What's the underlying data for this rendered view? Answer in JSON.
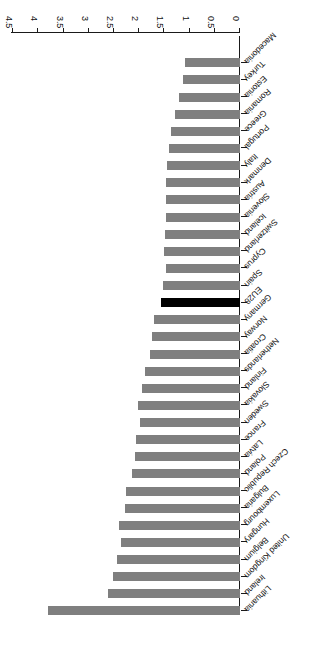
{
  "chart_data": {
    "type": "bar",
    "orientation": "horizontal",
    "title": "",
    "subtitle": "",
    "xlabel": "",
    "ylabel": "",
    "xlim": [
      0,
      4.5
    ],
    "grid": false,
    "legend": false,
    "rotation_deg": 180,
    "bar_color": "#7f7f7f",
    "highlight_color": "#000000",
    "highlight_category": "EU28",
    "axis_ticks": [
      "0",
      "0.5",
      "1",
      "1.5",
      "2",
      "2.5",
      "3",
      "3.5",
      "4",
      "4.5"
    ],
    "axis_tick_values": [
      0,
      0.5,
      1,
      1.5,
      2,
      2.5,
      3,
      3.5,
      4,
      4.5
    ],
    "categories": [
      "Lithuania",
      "Ireland",
      "United Kingdom",
      "Belgium",
      "Hungary",
      "Luxembourg",
      "Bulgaria",
      "Czech Republic",
      "Poland",
      "Latvia",
      "France",
      "Sweden",
      "Slovakia",
      "Finland",
      "Netherlands",
      "Croatia",
      "Norway",
      "Germany",
      "EU28",
      "Spain",
      "Cyprus",
      "Switzerland",
      "Iceland",
      "Slovenia",
      "Austria",
      "Denmark",
      "Italy",
      "Portugal",
      "Greece",
      "Romania",
      "Estonia",
      "Turkey",
      "Macedonia"
    ],
    "values": [
      3.81,
      2.62,
      2.52,
      2.44,
      2.36,
      2.4,
      2.28,
      2.26,
      2.14,
      2.08,
      2.06,
      1.98,
      2.02,
      1.94,
      1.88,
      1.78,
      1.74,
      1.7,
      1.57,
      1.52,
      1.46,
      1.5,
      1.48,
      1.46,
      1.46,
      1.46,
      1.44,
      1.4,
      1.36,
      1.28,
      1.22,
      1.14,
      1.1
    ]
  }
}
